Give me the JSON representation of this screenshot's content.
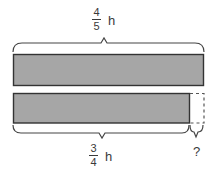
{
  "diagram": {
    "top_label": {
      "numerator": "4",
      "denominator": "5",
      "unit": "h"
    },
    "bottom_label": {
      "numerator": "3",
      "denominator": "4",
      "unit": "h"
    },
    "unknown_label": "?",
    "bars": [
      {
        "name": "full-bar",
        "represents": "4/5 h",
        "fill": "#a6a6a6"
      },
      {
        "name": "partial-bar",
        "represents": "3/4 h",
        "fill": "#a6a6a6",
        "missing_part": "dashed"
      }
    ],
    "colors": {
      "bar_fill": "#a6a6a6",
      "stroke": "#333333",
      "dashed": "#666666"
    }
  }
}
